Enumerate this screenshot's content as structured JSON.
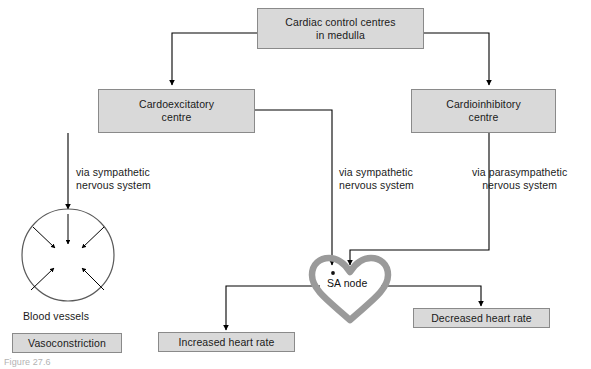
{
  "figure": {
    "caption": "Figure 27.6",
    "colors": {
      "box_fill": "#d9d9d9",
      "box_border": "#8a8a8a",
      "line": "#000000",
      "heart_outline": "#9a9a9a",
      "vessel_outline": "#5a5a5a",
      "text": "#1a1a1a",
      "caption_text": "#b3b3b3",
      "page_background": "#ffffff"
    }
  },
  "nodes": {
    "cardiac_control": {
      "line1": "Cardiac control centres",
      "line2": "in medulla"
    },
    "cardoexcitatory": {
      "line1": "Cardoexcitatory",
      "line2": "centre"
    },
    "cardioinhibitory": {
      "line1": "Cardioinhibitory",
      "line2": "centre"
    },
    "increased_heart_rate": {
      "label": "Increased heart rate"
    },
    "decreased_heart_rate": {
      "label": "Decreased heart rate"
    },
    "vasoconstriction": {
      "label": "Vasoconstriction"
    }
  },
  "labels": {
    "blood_vessels": "Blood vessels",
    "sa_node": "SA node",
    "via_sympathetic_left": "via sympathetic\nnervous system",
    "via_sympathetic_middle": "via sympathetic\nnervous system",
    "via_parasympathetic_right": "via parasympathetic\nnervous system"
  },
  "diagram_structure": {
    "type": "flowchart",
    "edges": [
      {
        "from": "cardiac_control",
        "to": "cardoexcitatory",
        "label": ""
      },
      {
        "from": "cardiac_control",
        "to": "cardioinhibitory",
        "label": ""
      },
      {
        "from": "cardoexcitatory",
        "to": "blood_vessels_circle",
        "label": "via sympathetic nervous system"
      },
      {
        "from": "cardoexcitatory",
        "to": "sa_node",
        "label": "via sympathetic nervous system"
      },
      {
        "from": "cardioinhibitory",
        "to": "sa_node",
        "label": "via parasympathetic nervous system"
      },
      {
        "from": "sa_node",
        "to": "increased_heart_rate",
        "label": ""
      },
      {
        "from": "sa_node",
        "to": "decreased_heart_rate",
        "label": ""
      },
      {
        "from": "blood_vessels_circle",
        "to": "vasoconstriction",
        "label": ""
      }
    ]
  }
}
